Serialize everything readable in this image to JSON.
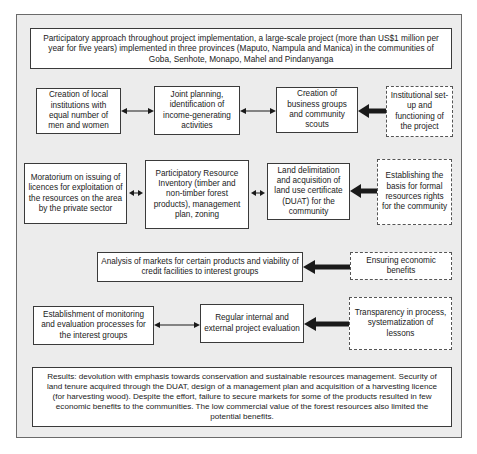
{
  "header": {
    "text": "Participatory approach throughout project implementation, a large-scale project (more than US$1 million per year for five years) implemented in three provinces (Maputo, Nampula and Manica) in the communities of Goba, Senhote, Monapo, Mahel and Pindanyanga"
  },
  "row1": {
    "box1": "Creation of local institutions with equal number of men and women",
    "box2": "Joint planning, identification of income-generating activities",
    "box3": "Creation of business groups and community scouts",
    "driver": "Institutional set-up and functioning of the project"
  },
  "row2": {
    "box1": "Moratorium on issuing of licences for exploitation of the resources on the area by the private sector",
    "box2": "Participatory Resource Inventory (timber and non-timber forest products), management plan, zoning",
    "box3": "Land delimitation and acquisition of land use certificate (DUAT) for the community",
    "driver": "Establishing the basis for formal resources rights for the community"
  },
  "row3": {
    "box1": "Analysis of markets for certain products and viability of credit facilities to interest groups",
    "driver": "Ensuring economic benefits"
  },
  "row4": {
    "box1": "Establishment of monitoring and evaluation processes for the interest groups",
    "box2": "Regular internal and external project evaluation",
    "driver": "Transparency in process, systematization of lessons"
  },
  "results": {
    "text": "Results: devolution with emphasis towards conservation and sustainable resources management. Security of land tenure acquired through the DUAT, design of a management plan and acquisition of a harvesting licence (for harvesting wood). Despite the effort, failure to secure markets for some of the products resulted in few economic benefits to the communities. The low commercial value of the forest resources also limited the potential benefits."
  },
  "colors": {
    "frame_bg": "#ececec",
    "box_bg": "#ffffff",
    "border": "#3a3a3a",
    "arrow": "#1a1a1a"
  }
}
